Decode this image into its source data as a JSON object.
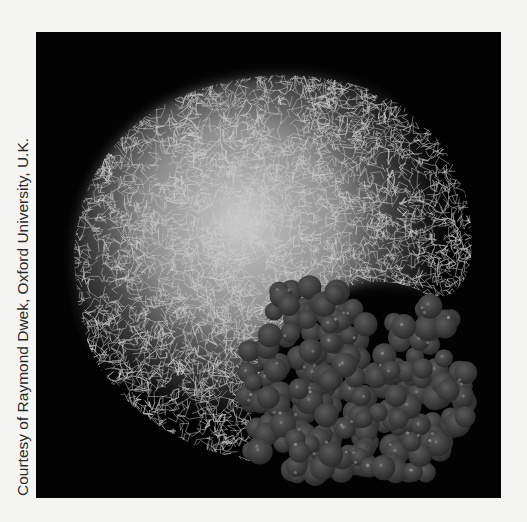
{
  "figure": {
    "credit": "Courtesy of Raymond Dwek, Oxford University, U.K.",
    "panel_background": "#030303",
    "page_background": "#f4f4f2",
    "subjects": [
      {
        "name": "glycan-wireframe-cloud",
        "color": "#d8d8d8"
      },
      {
        "name": "protein-space-filling-surface",
        "color": "#3a3a3a"
      }
    ]
  }
}
